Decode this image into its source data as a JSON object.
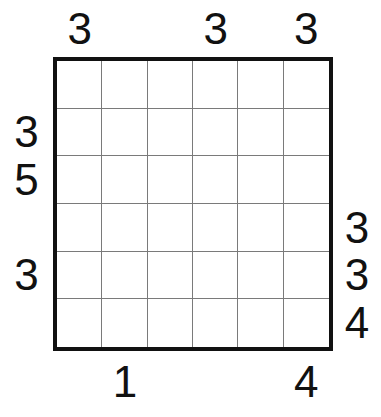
{
  "puzzle": {
    "title": "skyscrapers-grid",
    "size": 6,
    "clues": {
      "top": [
        "3",
        "",
        "",
        "3",
        "",
        "3"
      ],
      "left": [
        "",
        "3",
        "5",
        "",
        "3",
        ""
      ],
      "right": [
        "",
        "",
        "",
        "3",
        "3",
        "4"
      ],
      "bottom": [
        "",
        "1",
        "",
        "",
        "",
        "4"
      ]
    },
    "colors": {
      "background": "#ffffff",
      "outer_border": "#111111",
      "inner_grid_line": "#7a7a7a",
      "clue_text": "#111111"
    }
  }
}
